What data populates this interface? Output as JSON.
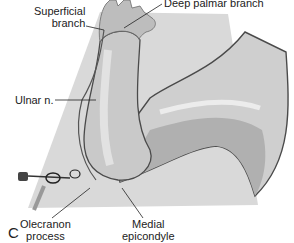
{
  "figure": {
    "panel_letter": "C",
    "labels": {
      "superficial_branch_1": "Superficial",
      "superficial_branch_2": "branch",
      "deep_palmar_branch": "Deep palmar branch",
      "ulnar_nerve": "Ulnar n.",
      "olecranon_1": "Olecranon",
      "olecranon_2": "process",
      "medial_epicondyle_1": "Medial",
      "medial_epicondyle_2": "epicondyle"
    },
    "colors": {
      "background_plane": "#d6d6d6",
      "skin_light": "#e4e4e4",
      "skin_mid": "#c8c8c8",
      "skin_dark": "#a9a9a9",
      "outline": "#4a4a4a",
      "nerve": "#555555"
    }
  }
}
